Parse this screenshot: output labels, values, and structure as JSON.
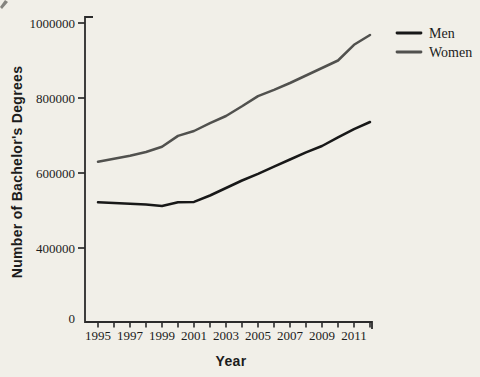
{
  "figure": {
    "background_color": "#f1efe8",
    "axis_color": "#2b2b2b",
    "text_color": "#1c1c1c"
  },
  "chart_data": {
    "type": "line",
    "title": "",
    "xlabel": "Year",
    "ylabel": "Number of Bachelor's Degrees",
    "x": [
      1995,
      1996,
      1997,
      1998,
      1999,
      2000,
      2001,
      2002,
      2003,
      2004,
      2005,
      2006,
      2007,
      2008,
      2009,
      2010,
      2011,
      2012
    ],
    "x_tick_labels": [
      "1995",
      "1997",
      "1999",
      "2001",
      "2003",
      "2005",
      "2007",
      "2009",
      "2011"
    ],
    "y_tick_labels": [
      "0",
      "400000",
      "600000",
      "800000",
      "1000000"
    ],
    "ylim": [
      0,
      1000000
    ],
    "grid": false,
    "legend_position": "top-right",
    "axis_note": "y-axis compressed between 0 and 400000 (no 200000 tick shown)",
    "series": [
      {
        "name": "Men",
        "color": "#181818",
        "values": [
          522000,
          520000,
          518000,
          516000,
          512000,
          522000,
          523000,
          540000,
          560000,
          580000,
          598000,
          617000,
          636000,
          655000,
          672000,
          695000,
          717000,
          736000
        ]
      },
      {
        "name": "Women",
        "color": "#51514e",
        "values": [
          630000,
          638000,
          646000,
          656000,
          670000,
          699000,
          712000,
          733000,
          752000,
          778000,
          805000,
          822000,
          840000,
          860000,
          880000,
          900000,
          942000,
          968000
        ]
      }
    ]
  }
}
